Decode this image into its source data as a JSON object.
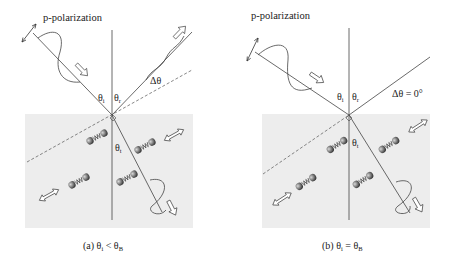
{
  "figure": {
    "panels": [
      {
        "id": "a",
        "polarization_label": "p-polarization",
        "theta_i": "θ",
        "theta_i_sub": "i",
        "theta_r": "θ",
        "theta_r_sub": "r",
        "theta_t": "θ",
        "theta_t_sub": "t",
        "delta_label": "Δθ",
        "caption_prefix": "(a) θ",
        "caption_sub_i": "i",
        "caption_rel": " < θ",
        "caption_sub_B": "B"
      },
      {
        "id": "b",
        "polarization_label": "p-polarization",
        "theta_i": "θ",
        "theta_i_sub": "i",
        "theta_r": "θ",
        "theta_r_sub": "r",
        "theta_t": "θ",
        "theta_t_sub": "t",
        "delta_label": "Δθ = 0°",
        "caption_prefix": "(b) θ",
        "caption_sub_i": "i",
        "caption_rel": " = θ",
        "caption_sub_B": "B"
      }
    ],
    "colors": {
      "line": "#333333",
      "medium": "#ececec",
      "dipole": "#6a6a6a"
    }
  }
}
